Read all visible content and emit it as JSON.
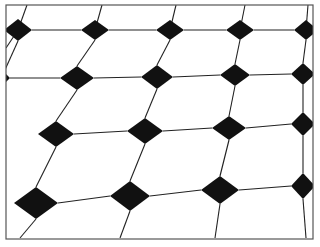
{
  "figure": {
    "frame": {
      "x": 6,
      "y": 5,
      "w": 307,
      "h": 234,
      "stroke": "#555555"
    },
    "colors": {
      "line": "#222222",
      "diamond": "#111111",
      "background": "#ffffff"
    },
    "rows": [
      {
        "diamonds": [
          [
            18,
            30,
            14,
            11
          ],
          [
            95,
            30,
            14,
            10
          ],
          [
            170,
            30,
            14,
            10
          ],
          [
            240,
            30,
            14,
            10
          ],
          [
            306,
            30,
            12,
            10
          ]
        ]
      },
      {
        "diamonds": [
          [
            4,
            78,
            6,
            6
          ],
          [
            77,
            78,
            17,
            12
          ],
          [
            157,
            77,
            16,
            12
          ],
          [
            235,
            75,
            15,
            11
          ],
          [
            303,
            74,
            12,
            11
          ]
        ]
      },
      {
        "diamonds": [
          [
            56,
            134,
            18,
            13
          ],
          [
            145,
            131,
            18,
            13
          ],
          [
            229,
            128,
            17,
            12
          ],
          [
            303,
            124,
            12,
            12
          ]
        ]
      },
      {
        "diamonds": [
          [
            36,
            203,
            22,
            16
          ],
          [
            130,
            196,
            20,
            15
          ],
          [
            220,
            190,
            19,
            14
          ],
          [
            303,
            186,
            12,
            13
          ]
        ]
      }
    ],
    "extra_lines": [
      [
        [
          27,
          5
        ],
        [
          18,
          30
        ]
      ],
      [
        [
          102,
          5
        ],
        [
          95,
          30
        ]
      ],
      [
        [
          176,
          5
        ],
        [
          170,
          30
        ]
      ],
      [
        [
          245,
          5
        ],
        [
          240,
          30
        ]
      ],
      [
        [
          308,
          5
        ],
        [
          306,
          30
        ]
      ],
      [
        [
          18,
          30
        ],
        [
          6,
          48
        ]
      ],
      [
        [
          20,
          238
        ],
        [
          36,
          219
        ]
      ],
      [
        [
          120,
          238
        ],
        [
          130,
          211
        ]
      ],
      [
        [
          215,
          238
        ],
        [
          220,
          204
        ]
      ],
      [
        [
          306,
          238
        ],
        [
          303,
          199
        ]
      ]
    ]
  }
}
